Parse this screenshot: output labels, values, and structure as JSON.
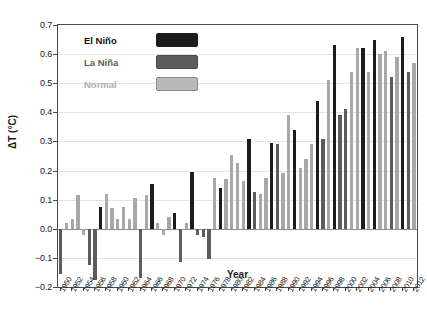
{
  "chart_data": {
    "type": "bar",
    "title": "",
    "xlabel": "Year",
    "ylabel": "ΔT (°C)",
    "ylim": [
      -0.2,
      0.7
    ],
    "ytick_step": 0.1,
    "yticks": [
      "0.7",
      "0.6",
      "0.5",
      "0.4",
      "0.3",
      "0.2",
      "0.1",
      "0.0",
      "−0.1",
      "−0.2"
    ],
    "xlim": [
      1950,
      2012
    ],
    "xtick_labels": [
      "1950",
      "1952",
      "1954",
      "1956",
      "1958",
      "1960",
      "1962",
      "1964",
      "1966",
      "1968",
      "1970",
      "1972",
      "1974",
      "1976",
      "1978",
      "1980",
      "1982",
      "1984",
      "1986",
      "1988",
      "1990",
      "1992",
      "1994",
      "1996",
      "1998",
      "2000",
      "2002",
      "2004",
      "2006",
      "2008",
      "2010",
      "2012"
    ],
    "grid": "horizontal",
    "legend_position": "top-left-inside",
    "categories": [
      1950,
      1951,
      1952,
      1953,
      1954,
      1955,
      1956,
      1957,
      1958,
      1959,
      1960,
      1961,
      1962,
      1963,
      1964,
      1965,
      1966,
      1967,
      1968,
      1969,
      1970,
      1971,
      1972,
      1973,
      1974,
      1975,
      1976,
      1977,
      1978,
      1979,
      1980,
      1981,
      1982,
      1983,
      1984,
      1985,
      1986,
      1987,
      1988,
      1989,
      1990,
      1991,
      1992,
      1993,
      1994,
      1995,
      1996,
      1997,
      1998,
      1999,
      2000,
      2001,
      2002,
      2003,
      2004,
      2005,
      2006,
      2007,
      2008,
      2009,
      2010,
      2011,
      2012
    ],
    "values": [
      -0.155,
      0.02,
      0.035,
      0.115,
      -0.02,
      -0.125,
      -0.175,
      0.075,
      0.12,
      0.07,
      0.035,
      0.075,
      0.035,
      0.105,
      -0.17,
      0.115,
      0.155,
      0.02,
      -0.02,
      0.04,
      0.055,
      -0.115,
      0.02,
      0.195,
      -0.02,
      -0.03,
      -0.105,
      0.175,
      0.14,
      0.17,
      0.255,
      0.225,
      0.165,
      0.31,
      0.125,
      0.12,
      0.175,
      0.295,
      0.29,
      0.19,
      0.39,
      0.34,
      0.21,
      0.24,
      0.29,
      0.44,
      0.31,
      0.51,
      0.63,
      0.39,
      0.41,
      0.54,
      0.62,
      0.62,
      0.54,
      0.65,
      0.6,
      0.61,
      0.52,
      0.59,
      0.66,
      0.54,
      0.57
    ],
    "classes": [
      "lanina",
      "normal",
      "normal",
      "normal",
      "normal",
      "lanina",
      "lanina",
      "elnino",
      "normal",
      "normal",
      "normal",
      "normal",
      "normal",
      "normal",
      "lanina",
      "normal",
      "elnino",
      "normal",
      "normal",
      "normal",
      "elnino",
      "lanina",
      "normal",
      "elnino",
      "lanina",
      "lanina",
      "lanina",
      "normal",
      "elnino",
      "normal",
      "normal",
      "normal",
      "normal",
      "elnino",
      "lanina",
      "normal",
      "normal",
      "elnino",
      "lanina",
      "normal",
      "normal",
      "elnino",
      "normal",
      "normal",
      "normal",
      "elnino",
      "lanina",
      "normal",
      "elnino",
      "lanina",
      "lanina",
      "normal",
      "normal",
      "elnino",
      "normal",
      "elnino",
      "normal",
      "normal",
      "lanina",
      "normal",
      "elnino",
      "lanina",
      "normal"
    ],
    "series": [
      {
        "name": "El Niño",
        "color": "#1c1c1c"
      },
      {
        "name": "La Niña",
        "color": "#5c5c5c"
      },
      {
        "name": "Normal",
        "color": "#b9b9b9"
      }
    ]
  },
  "legend": {
    "items": [
      {
        "label": "El Niño",
        "key": "elnino"
      },
      {
        "label": "La Niña",
        "key": "lanina"
      },
      {
        "label": "Normal",
        "key": "normal"
      }
    ]
  },
  "axes": {
    "y_title": "ΔT (°C)",
    "x_title": "Year"
  }
}
